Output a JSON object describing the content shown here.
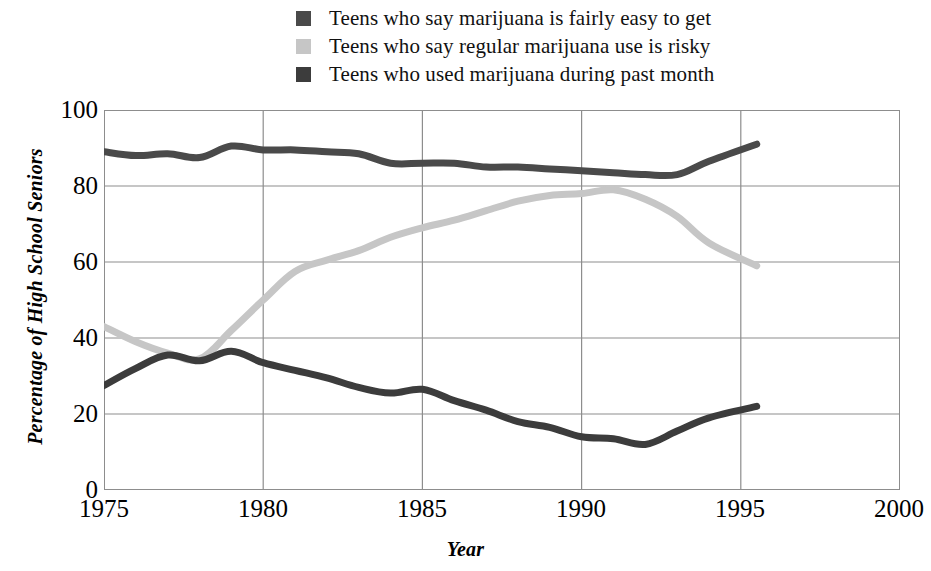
{
  "chart_data": {
    "type": "line",
    "title": "",
    "xlabel": "Year",
    "ylabel": "Percentage of High School Seniors",
    "xlim": [
      1975,
      2000
    ],
    "ylim": [
      0,
      100
    ],
    "xticks": [
      1975,
      1980,
      1985,
      1990,
      1995,
      2000
    ],
    "yticks": [
      0,
      20,
      40,
      60,
      80,
      100
    ],
    "grid": true,
    "legend_position": "top-center",
    "series": [
      {
        "name": "Teens who say marijuana is fairly easy to get",
        "color": "#4a4a4a",
        "x": [
          1975,
          1976,
          1977,
          1978,
          1979,
          1980,
          1981,
          1982,
          1983,
          1984,
          1985,
          1986,
          1987,
          1988,
          1989,
          1990,
          1991,
          1992,
          1993,
          1994,
          1995.5
        ],
        "values": [
          89,
          88,
          88.5,
          87.5,
          90.5,
          89.5,
          89.5,
          89,
          88.5,
          86,
          86,
          86,
          85,
          85,
          84.5,
          84,
          83.5,
          83,
          83,
          86.5,
          91
        ]
      },
      {
        "name": "Teens who say regular marijuana use is risky",
        "color": "#c6c6c6",
        "x": [
          1975,
          1976,
          1977,
          1978,
          1979,
          1980,
          1981,
          1982,
          1983,
          1984,
          1985,
          1986,
          1987,
          1988,
          1989,
          1990,
          1991,
          1992,
          1993,
          1994,
          1995.5
        ],
        "values": [
          43,
          39,
          36,
          34.5,
          42,
          50,
          57.5,
          60.5,
          63,
          66.5,
          69,
          71,
          73.5,
          76,
          77.5,
          78,
          79,
          76.5,
          72,
          65,
          59
        ]
      },
      {
        "name": "Teens who used marijuana during past month",
        "color": "#3c3c3c",
        "x": [
          1975,
          1976,
          1977,
          1978,
          1979,
          1980,
          1981,
          1982,
          1983,
          1984,
          1985,
          1986,
          1987,
          1988,
          1989,
          1990,
          1991,
          1992,
          1993,
          1994,
          1995.5
        ],
        "values": [
          27.5,
          32,
          35.5,
          34,
          36.5,
          33.5,
          31.5,
          29.5,
          27,
          25.5,
          26.5,
          23.5,
          21,
          18,
          16.5,
          14,
          13.5,
          12,
          15.5,
          19,
          22
        ]
      }
    ]
  },
  "legend": {
    "items": [
      {
        "label": "Teens who say marijuana is fairly easy to get",
        "color": "#4a4a4a"
      },
      {
        "label": "Teens who say regular marijuana use is risky",
        "color": "#c6c6c6"
      },
      {
        "label": "Teens who used marijuana during past month",
        "color": "#3c3c3c"
      }
    ]
  },
  "axes": {
    "x_title": "Year",
    "y_title": "Percentage of High School Seniors",
    "x_ticks": [
      "1975",
      "1980",
      "1985",
      "1990",
      "1995",
      "2000"
    ],
    "y_ticks": [
      "100",
      "80",
      "60",
      "40",
      "20",
      "0"
    ]
  },
  "colors": {
    "grid": "#8d8d8d",
    "frame": "#8d8d8d",
    "dark_series": "#4a4a4a",
    "light_series": "#c6c6c6",
    "text": "#000000",
    "background": "#ffffff"
  }
}
